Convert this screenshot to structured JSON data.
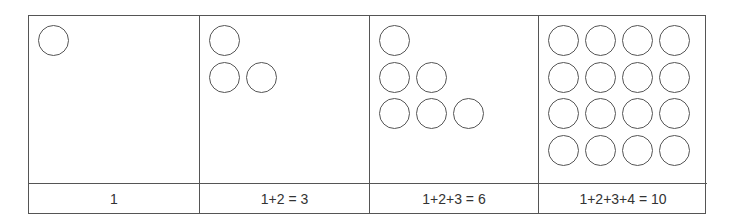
{
  "panels": [
    {
      "label": "1",
      "rows": [
        1
      ],
      "grid": null
    },
    {
      "label": "1+2 = 3",
      "rows": [
        1,
        2
      ],
      "grid": null
    },
    {
      "label": "1+2+3 = 6",
      "rows": [
        1,
        2,
        3
      ],
      "grid": null
    },
    {
      "label": "1+2+3+4 = 10",
      "rows": null,
      "grid": {
        "cols": 4,
        "rows": 4
      }
    }
  ],
  "colors": {
    "line": "#555555",
    "text": "#333333",
    "background": "#ffffff"
  }
}
